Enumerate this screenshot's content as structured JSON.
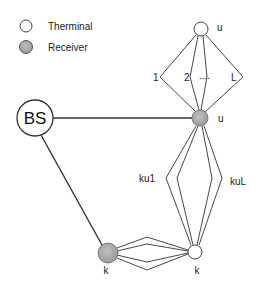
{
  "legend": {
    "items": [
      {
        "label": "Therminal",
        "icon": "terminal-node-icon",
        "fill": "#ffffff"
      },
      {
        "label": "Receiver",
        "icon": "receiver-node-icon",
        "fill": "#a8a8a8"
      }
    ]
  },
  "nodes": {
    "bs": {
      "label": "BS"
    },
    "terminal_u": {
      "label": "u"
    },
    "receiver_u": {
      "label": "u"
    },
    "receiver_k": {
      "label": "k"
    },
    "terminal_k": {
      "label": "k"
    }
  },
  "paths": {
    "top": [
      "1",
      "2",
      "....",
      "L"
    ],
    "vertical": [
      "ku1",
      "kuL"
    ]
  },
  "colors": {
    "line": "#222222",
    "receiver_fill": "#a8a8a8",
    "terminal_fill": "#ffffff"
  }
}
